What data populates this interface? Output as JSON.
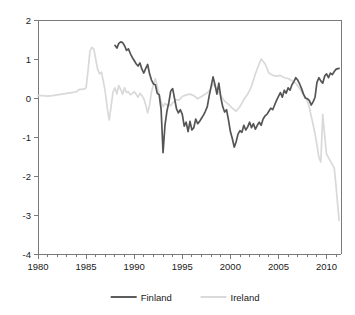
{
  "chart_data": {
    "type": "line",
    "title": "",
    "subtitle": "",
    "xlabel": "",
    "ylabel": "",
    "xlim": [
      1980,
      2011.5
    ],
    "ylim": [
      -4,
      2
    ],
    "grid": false,
    "legend_position": "bottom",
    "x_ticks": [
      1980,
      1985,
      1990,
      1995,
      2000,
      2005,
      2010
    ],
    "x_tick_labels": [
      "1980",
      "1985",
      "1990",
      "1995",
      "2000",
      "2005",
      "2010"
    ],
    "x_minor_tick_step": 1,
    "y_ticks": [
      2,
      1,
      0,
      -1,
      -2,
      -3,
      -4
    ],
    "y_tick_labels": [
      "2",
      "1",
      "0",
      "-1",
      "-2",
      "-3",
      "-4"
    ],
    "series": [
      {
        "name": "Finland",
        "color": "#555555",
        "line_width": 1.7,
        "x_start": 1988.0,
        "x_end": 2011.3,
        "x": [
          1988.0,
          1988.2,
          1988.4,
          1988.6,
          1988.8,
          1989.0,
          1989.2,
          1989.4,
          1989.6,
          1989.8,
          1990.0,
          1990.2,
          1990.4,
          1990.6,
          1990.8,
          1991.0,
          1991.2,
          1991.4,
          1991.6,
          1991.8,
          1992.0,
          1992.2,
          1992.4,
          1992.6,
          1992.8,
          1993.0,
          1993.2,
          1993.4,
          1993.6,
          1993.8,
          1994.0,
          1994.2,
          1994.4,
          1994.6,
          1994.8,
          1995.0,
          1995.2,
          1995.4,
          1995.6,
          1995.8,
          1996.0,
          1996.2,
          1996.4,
          1996.6,
          1996.8,
          1997.0,
          1997.2,
          1997.4,
          1997.6,
          1997.8,
          1998.0,
          1998.2,
          1998.4,
          1998.6,
          1998.8,
          1999.0,
          1999.2,
          1999.4,
          1999.6,
          1999.8,
          2000.0,
          2000.2,
          2000.4,
          2000.6,
          2000.8,
          2001.0,
          2001.2,
          2001.4,
          2001.6,
          2001.8,
          2002.0,
          2002.2,
          2002.4,
          2002.6,
          2002.8,
          2003.0,
          2003.2,
          2003.4,
          2003.6,
          2003.8,
          2004.0,
          2004.2,
          2004.4,
          2004.6,
          2004.8,
          2005.0,
          2005.2,
          2005.4,
          2005.6,
          2005.8,
          2006.0,
          2006.2,
          2006.4,
          2006.6,
          2006.8,
          2007.0,
          2007.2,
          2007.4,
          2007.6,
          2007.8,
          2008.0,
          2008.2,
          2008.4,
          2008.6,
          2008.8,
          2009.0,
          2009.2,
          2009.4,
          2009.6,
          2009.8,
          2010.0,
          2010.2,
          2010.4,
          2010.6,
          2010.8,
          2011.0,
          2011.3
        ],
        "values": [
          1.35,
          1.28,
          1.4,
          1.44,
          1.42,
          1.34,
          1.22,
          1.26,
          1.14,
          1.04,
          0.96,
          0.88,
          0.82,
          0.9,
          0.74,
          0.64,
          0.76,
          0.86,
          0.62,
          0.46,
          0.36,
          0.34,
          0.12,
          0.08,
          -0.3,
          -1.4,
          -0.7,
          -0.34,
          -0.12,
          0.18,
          0.24,
          -0.02,
          -0.28,
          -0.38,
          -0.3,
          -0.42,
          -0.72,
          -0.62,
          -0.86,
          -0.6,
          -0.82,
          -0.76,
          -0.54,
          -0.66,
          -0.6,
          -0.52,
          -0.44,
          -0.34,
          -0.22,
          0.06,
          0.3,
          0.54,
          0.34,
          0.1,
          0.38,
          0.02,
          -0.22,
          -0.36,
          -0.3,
          -0.56,
          -0.86,
          -1.04,
          -1.26,
          -1.12,
          -0.92,
          -0.84,
          -0.88,
          -0.7,
          -0.82,
          -0.74,
          -0.62,
          -0.76,
          -0.66,
          -0.8,
          -0.7,
          -0.62,
          -0.7,
          -0.54,
          -0.46,
          -0.42,
          -0.34,
          -0.26,
          -0.3,
          -0.18,
          -0.06,
          0.04,
          0.14,
          0.02,
          0.2,
          0.12,
          0.26,
          0.2,
          0.34,
          0.42,
          0.52,
          0.46,
          0.36,
          0.24,
          0.1,
          0.0,
          -0.02,
          -0.06,
          -0.18,
          -0.1,
          0.02,
          0.4,
          0.52,
          0.44,
          0.38,
          0.56,
          0.62,
          0.52,
          0.64,
          0.6,
          0.68,
          0.74,
          0.76
        ]
      },
      {
        "name": "Ireland",
        "color": "#d9d9d9",
        "line_width": 1.7,
        "x_start": 1980.0,
        "x_end": 2011.3,
        "x": [
          1980.0,
          1980.5,
          1981.0,
          1981.5,
          1982.0,
          1982.5,
          1983.0,
          1983.5,
          1984.0,
          1984.3,
          1984.6,
          1984.9,
          1985.0,
          1985.2,
          1985.4,
          1985.6,
          1985.8,
          1986.0,
          1986.2,
          1986.4,
          1986.6,
          1986.8,
          1987.0,
          1987.2,
          1987.4,
          1987.6,
          1987.8,
          1988.0,
          1988.2,
          1988.4,
          1988.6,
          1988.8,
          1989.0,
          1989.2,
          1989.4,
          1989.6,
          1989.8,
          1990.0,
          1990.2,
          1990.4,
          1990.6,
          1990.8,
          1991.0,
          1991.2,
          1991.4,
          1991.6,
          1991.8,
          1992.0,
          1992.2,
          1992.4,
          1992.6,
          1992.8,
          1993.0,
          1993.2,
          1993.4,
          1993.6,
          1993.8,
          1994.0,
          1994.2,
          1994.4,
          1994.6,
          1994.8,
          1995.0,
          1995.4,
          1995.8,
          1996.2,
          1996.6,
          1997.0,
          1997.4,
          1997.8,
          1998.0,
          1998.2,
          1998.4,
          1998.6,
          1998.8,
          1999.0,
          1999.4,
          1999.8,
          2000.2,
          2000.6,
          2001.0,
          2001.4,
          2001.8,
          2002.2,
          2002.6,
          2003.0,
          2003.2,
          2003.6,
          2004.0,
          2004.4,
          2004.8,
          2005.2,
          2005.6,
          2006.0,
          2006.4,
          2006.8,
          2007.2,
          2007.6,
          2008.0,
          2008.2,
          2008.4,
          2008.6,
          2008.8,
          2009.0,
          2009.2,
          2009.4,
          2009.6,
          2009.8,
          2010.0,
          2010.4,
          2010.8,
          2011.0,
          2011.3
        ],
        "values": [
          0.06,
          0.06,
          0.05,
          0.06,
          0.08,
          0.1,
          0.12,
          0.14,
          0.16,
          0.22,
          0.22,
          0.24,
          0.26,
          0.7,
          1.2,
          1.3,
          1.26,
          1.0,
          0.74,
          0.62,
          0.66,
          0.42,
          0.14,
          -0.26,
          -0.56,
          -0.22,
          0.16,
          0.26,
          0.1,
          0.32,
          0.22,
          0.1,
          0.26,
          0.14,
          0.16,
          0.08,
          0.12,
          0.16,
          0.1,
          0.02,
          0.12,
          0.06,
          -0.02,
          -0.18,
          -0.38,
          -0.18,
          0.16,
          0.34,
          0.5,
          0.3,
          0.1,
          -0.1,
          -0.22,
          -0.14,
          -0.18,
          -0.16,
          -0.2,
          -0.12,
          -0.1,
          -0.04,
          -0.06,
          -0.02,
          0.04,
          0.08,
          0.1,
          0.06,
          -0.02,
          0.04,
          0.1,
          0.18,
          0.26,
          0.36,
          0.3,
          0.2,
          0.14,
          0.06,
          -0.08,
          -0.16,
          -0.26,
          -0.34,
          -0.22,
          -0.04,
          0.1,
          0.3,
          0.62,
          0.88,
          1.0,
          0.88,
          0.64,
          0.58,
          0.56,
          0.58,
          0.52,
          0.5,
          0.44,
          0.38,
          0.24,
          0.08,
          -0.08,
          -0.24,
          -0.46,
          -0.68,
          -0.92,
          -1.2,
          -1.52,
          -1.64,
          -0.42,
          -0.96,
          -1.44,
          -1.62,
          -1.8,
          -2.3,
          -3.14
        ]
      }
    ]
  },
  "legend": {
    "items": [
      {
        "label": "Finland",
        "color": "#555555"
      },
      {
        "label": "Ireland",
        "color": "#d9d9d9"
      }
    ]
  },
  "axes": {
    "y_top_label": "2",
    "y_bottom_label": "-4",
    "x_left_label": "1980",
    "x_right_label": "2010"
  }
}
